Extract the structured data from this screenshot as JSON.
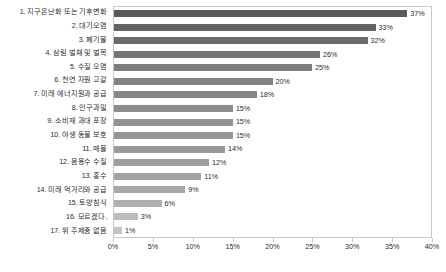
{
  "chart_data": {
    "type": "bar",
    "orientation": "horizontal",
    "title": "",
    "subtitle": "",
    "xlabel": "",
    "ylabel": "",
    "xlim": [
      0,
      40
    ],
    "grid": false,
    "legend": false,
    "tick_suffix": "%",
    "xticks": [
      "0%",
      "5%",
      "10%",
      "15%",
      "20%",
      "25%",
      "30%",
      "35%",
      "40%"
    ],
    "xtick_values": [
      0,
      5,
      10,
      15,
      20,
      25,
      30,
      35,
      40
    ],
    "categories": [
      "1. 지구온난화 또는 기후변화",
      "2. 대기오염",
      "3. 폐기물",
      "4. 삼림 벌채 및 벌목",
      "5. 수질 오염",
      "6. 천연 자원 고갈",
      "7. 미래 에너지원과 공급",
      "8. 인구과밀",
      "9. 소비재 과대 포장",
      "10. 야생 동물 보호",
      "11. 매몰",
      "12. 음용수 수질",
      "13. 홍수",
      "14. 미래 먹거리와 공급",
      "15. 토양침식",
      "16. 모르겠다.",
      "17. 위 주제중 없음"
    ],
    "values": [
      37,
      33,
      32,
      26,
      25,
      20,
      18,
      15,
      15,
      15,
      14,
      12,
      11,
      9,
      6,
      3,
      1
    ],
    "value_labels": [
      "37%",
      "33%",
      "32%",
      "26%",
      "25%",
      "20%",
      "18%",
      "15%",
      "15%",
      "15%",
      "14%",
      "12%",
      "11%",
      "9%",
      "6%",
      "3%",
      "1%"
    ],
    "bar_colors": [
      "#595959",
      "#636363",
      "#6b6b6b",
      "#757575",
      "#7d7d7d",
      "#838383",
      "#888888",
      "#8d8d8d",
      "#919191",
      "#959595",
      "#999999",
      "#9e9e9e",
      "#a3a3a3",
      "#a8a8a8",
      "#b0b0b0",
      "#bcbcbc",
      "#c4c4c4"
    ]
  }
}
